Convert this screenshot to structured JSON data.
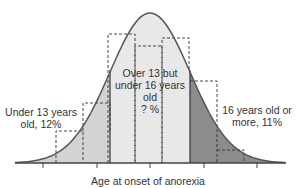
{
  "chart_data": {
    "type": "area",
    "title": "",
    "xlabel": "Age at onset of anorexia",
    "ylabel": "",
    "regions": [
      {
        "name": "Under 13 years old",
        "label": "Under 13 years old, 12%",
        "value_percent": 12,
        "fill": "#d3d3d3"
      },
      {
        "name": "Over 13 but under 16 years old",
        "label": "Over 13 but under 16 years old ? %",
        "value_percent": null,
        "fill": "#e8e8e8"
      },
      {
        "name": "16 years old or more",
        "label": "16 years old or more, 11%",
        "value_percent": 11,
        "fill": "#8c8c8c"
      }
    ],
    "histogram_bars_relative_height": [
      0.03,
      0.21,
      0.4,
      0.86,
      0.78,
      0.83,
      0.55,
      0.09
    ],
    "grid": false,
    "legend": null
  },
  "labels": {
    "left_line1": "Under 13 years",
    "left_line2": "old, 12%",
    "middle_line1": "Over 13 but",
    "middle_line2": "under 16 years old",
    "middle_line3": "? %",
    "right_line1": "16 years old or",
    "right_line2": "more, 11%",
    "xaxis_title": "Age at onset of anorexia"
  },
  "colors": {
    "left_fill": "#d3d3d3",
    "middle_fill": "#e8e8e8",
    "right_fill": "#8c8c8c",
    "curve_stroke": "#555555",
    "axis": "#444444",
    "dashed": "#333333"
  }
}
